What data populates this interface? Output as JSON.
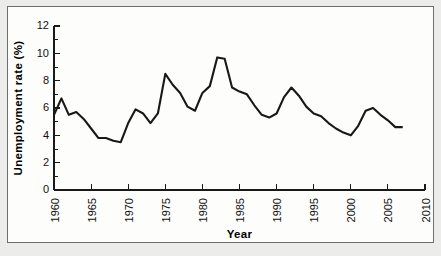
{
  "figure": {
    "background_color": "#ececeb",
    "panel_color": "#fdfdfc",
    "line_color": "#18181a",
    "axis_color": "#1a1a1a"
  },
  "chart_data": {
    "type": "line",
    "title": "",
    "xlabel": "Year",
    "ylabel": "Unemployment rate (%)",
    "xlim": [
      1960,
      2010
    ],
    "ylim": [
      0,
      12
    ],
    "ytick_values": [
      0,
      2,
      4,
      6,
      8,
      10,
      12
    ],
    "ytick_labels": [
      "0",
      "2",
      "4",
      "6",
      "8",
      "10",
      "12"
    ],
    "ytick_step_minor": 1,
    "xtick_values": [
      1960,
      1965,
      1970,
      1975,
      1980,
      1985,
      1990,
      1995,
      2000,
      2005,
      2010
    ],
    "xtick_labels": [
      "1960",
      "1965",
      "1970",
      "1975",
      "1980",
      "1985",
      "1990",
      "1995",
      "2000",
      "2005",
      "2010"
    ],
    "xtick_step_minor": 1,
    "xtick_label_rotation": -90,
    "grid": false,
    "legend": null,
    "series": [
      {
        "name": "Unemployment rate",
        "x": [
          1960,
          1961,
          1962,
          1963,
          1964,
          1965,
          1966,
          1967,
          1968,
          1969,
          1970,
          1971,
          1972,
          1973,
          1974,
          1975,
          1976,
          1977,
          1978,
          1979,
          1980,
          1981,
          1982,
          1983,
          1984,
          1985,
          1986,
          1987,
          1988,
          1989,
          1990,
          1991,
          1992,
          1993,
          1994,
          1995,
          1996,
          1997,
          1998,
          1999,
          2000,
          2001,
          2002,
          2003,
          2004,
          2005,
          2006,
          2007
        ],
        "values": [
          5.5,
          6.7,
          5.5,
          5.7,
          5.2,
          4.5,
          3.8,
          3.8,
          3.6,
          3.5,
          4.9,
          5.9,
          5.6,
          4.9,
          5.6,
          8.5,
          7.7,
          7.1,
          6.1,
          5.8,
          7.1,
          7.6,
          9.7,
          9.6,
          7.5,
          7.2,
          7.0,
          6.2,
          5.5,
          5.3,
          5.6,
          6.8,
          7.5,
          6.9,
          6.1,
          5.6,
          5.4,
          4.9,
          4.5,
          4.2,
          4.0,
          4.7,
          5.8,
          6.0,
          5.5,
          5.1,
          4.6,
          4.6
        ]
      }
    ]
  }
}
